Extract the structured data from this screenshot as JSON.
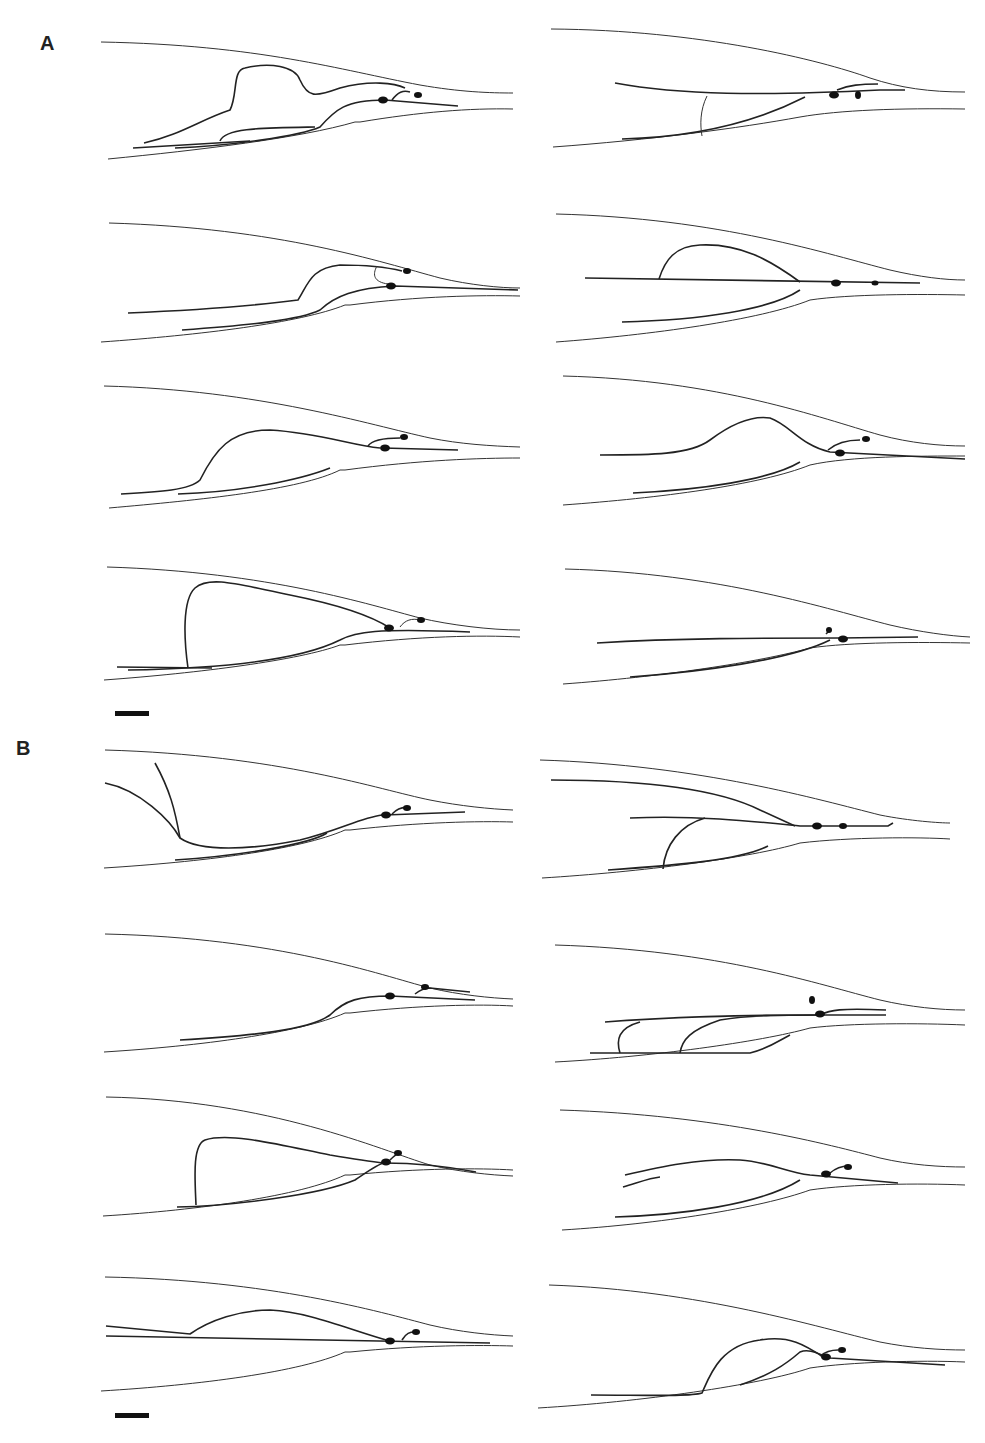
{
  "figure": {
    "panel_labels": [
      "A",
      "B"
    ],
    "caption_fragment": "",
    "line_color": "#222222",
    "background": "#ffffff"
  },
  "scale_bars": [
    {
      "id": "scale-bar-a",
      "x": 115,
      "y": 711,
      "w": 34
    },
    {
      "id": "scale-bar-b",
      "x": 115,
      "y": 1413,
      "w": 34
    }
  ]
}
